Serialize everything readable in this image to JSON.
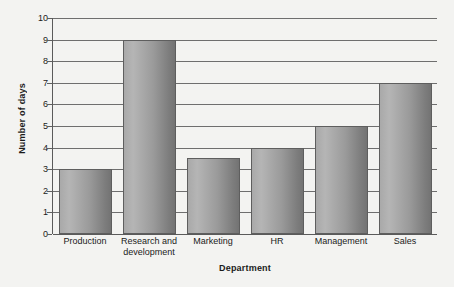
{
  "chart_data": {
    "type": "bar",
    "title": "",
    "xlabel": "Department",
    "ylabel": "Number of days",
    "categories": [
      "Production",
      "Research and development",
      "Marketing",
      "HR",
      "Management",
      "Sales"
    ],
    "values": [
      3,
      9,
      3.5,
      4,
      5,
      7
    ],
    "ylim": [
      0,
      10
    ],
    "yticks": [
      "0",
      "1",
      "2",
      "3",
      "4",
      "5",
      "6",
      "7",
      "8",
      "9",
      "10"
    ],
    "grid": true,
    "legend": "none",
    "bar_fill_left": "#b5b5b5",
    "bar_fill_right": "#737373",
    "bar_border": "#5e5e5e",
    "gridline_color": "#6e6e6e",
    "background": "#f3f3f1"
  }
}
